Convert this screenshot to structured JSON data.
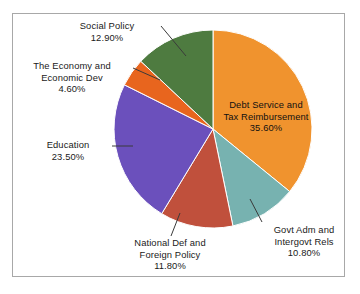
{
  "chart_data": {
    "type": "pie",
    "title": "",
    "xlabel": "",
    "ylabel": "",
    "legend_position": "none",
    "grid": false,
    "units": "percent",
    "start_angle_deg": 0,
    "direction": "clockwise",
    "categories": [
      "Debt Service and Tax Reimbursement",
      "Govt Adm and Intergovt Rels",
      "National Def and Foreign Policy",
      "Education",
      "The Economy and Economic Dev",
      "Social Policy"
    ],
    "values": [
      35.6,
      10.8,
      11.8,
      23.5,
      4.6,
      12.9
    ],
    "colors": [
      "#f0932e",
      "#77b2b0",
      "#c0503c",
      "#6b50bc",
      "#e8651e",
      "#4e7b40"
    ],
    "slices": [
      {
        "name": "Debt Service and Tax Reimbursement",
        "value": 35.6,
        "value_label": "35.60%",
        "color": "#f0932e",
        "label_line1": "Debt Service and",
        "label_line2": "Tax Reimbursement",
        "label_placement": "inside"
      },
      {
        "name": "Govt Adm and Intergovt Rels",
        "value": 10.8,
        "value_label": "10.80%",
        "color": "#77b2b0",
        "label_line1": "Govt Adm and",
        "label_line2": "Intergovt Rels",
        "label_placement": "outside"
      },
      {
        "name": "National Def and Foreign Policy",
        "value": 11.8,
        "value_label": "11.80%",
        "color": "#c0503c",
        "label_line1": "National Def and",
        "label_line2": "Foreign Policy",
        "label_placement": "outside"
      },
      {
        "name": "Education",
        "value": 23.5,
        "value_label": "23.50%",
        "color": "#6b50bc",
        "label_line1": "Education",
        "label_line2": "",
        "label_placement": "outside"
      },
      {
        "name": "The Economy and Economic Dev",
        "value": 4.6,
        "value_label": "4.60%",
        "color": "#e8651e",
        "label_line1": "The Economy and",
        "label_line2": "Economic Dev",
        "label_placement": "outside"
      },
      {
        "name": "Social Policy",
        "value": 12.9,
        "value_label": "12.90%",
        "color": "#4e7b40",
        "label_line1": "Social Policy",
        "label_line2": "",
        "label_placement": "outside"
      }
    ]
  },
  "frame": {
    "border_color": "#a8a8a8",
    "background": "#ffffff"
  }
}
